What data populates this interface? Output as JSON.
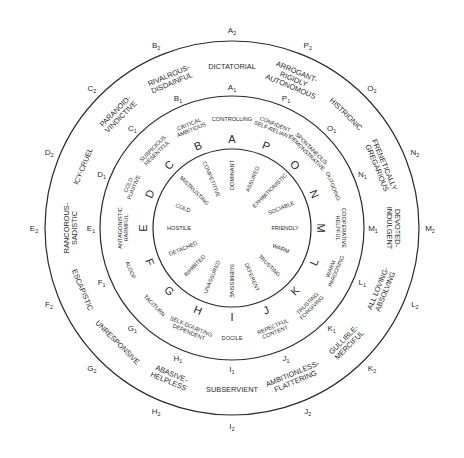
{
  "diagram": {
    "title": "",
    "center": {
      "x": 232,
      "y": 228
    },
    "radii": {
      "inner": 79,
      "middle": 132,
      "outer": 187
    },
    "line_color": "#2a2a2a",
    "octants": [
      {
        "letter": "A",
        "angle": -90,
        "inner": "DOMINANT",
        "ring1": [
          "CONTROLLING"
        ],
        "ring1_label": "A",
        "ring2": [
          "DICTATORIAL"
        ],
        "ring2_label": "A"
      },
      {
        "letter": "P",
        "angle": -67.5,
        "inner": "ASSURED",
        "ring1": [
          "CONFIDENT",
          "SELF-RELIANT"
        ],
        "ring1_label": "P",
        "ring2": [
          "ARROGANT-",
          "RIGIDLY",
          "AUTONOMOUS"
        ],
        "ring2_label": "P"
      },
      {
        "letter": "O",
        "angle": -45,
        "inner": "EXHIBITIONISTIC",
        "ring1": [
          "SPONTANEOUS",
          "DEMONSTRATIVE"
        ],
        "ring1_label": "O",
        "ring2": [
          "HISTRIONIC"
        ],
        "ring2_label": "O"
      },
      {
        "letter": "N",
        "angle": -22.5,
        "inner": "SOCIABLE",
        "ring1": [
          "OUTGOING"
        ],
        "ring1_label": "N",
        "ring2": [
          "FRENETICALLY",
          "GREGARIOUS"
        ],
        "ring2_label": "N"
      },
      {
        "letter": "M",
        "angle": 0,
        "inner": "FRIENDLY",
        "ring1": [
          "COOPERATIVE",
          "HELPFUL"
        ],
        "ring1_label": "M",
        "ring2": [
          "DEVOTED-",
          "INDULGENT"
        ],
        "ring2_label": "M"
      },
      {
        "letter": "L",
        "angle": 22.5,
        "inner": "WARM",
        "ring1": [
          "WARM",
          "PARDONING"
        ],
        "ring1_label": "L",
        "ring2": [
          "ALL LOVING-",
          "ABSOLVING"
        ],
        "ring2_label": "L"
      },
      {
        "letter": "K",
        "angle": 45,
        "inner": "TRUSTING",
        "ring1": [
          "TRUSTING",
          "FORGIVING"
        ],
        "ring1_label": "K",
        "ring2": [
          "GULLIBLE-",
          "MERCIFUL"
        ],
        "ring2_label": "K"
      },
      {
        "letter": "J",
        "angle": 67.5,
        "inner": "DEFERENT",
        "ring1": [
          "REPECTFUL",
          "CONTENT"
        ],
        "ring1_label": "J",
        "ring2": [
          "AMBITIONLESS-",
          "FLATTERING"
        ],
        "ring2_label": "J"
      },
      {
        "letter": "I",
        "angle": 90,
        "inner": "SUBMISSIVE",
        "ring1": [
          "DOCILE"
        ],
        "ring1_label": "I",
        "ring2": [
          "SUBSERVIENT"
        ],
        "ring2_label": "I"
      },
      {
        "letter": "H",
        "angle": 112.5,
        "inner": "UNASSURED",
        "ring1": [
          "SELF-DOUBTING",
          "DEPENDENT"
        ],
        "ring1_label": "H",
        "ring2": [
          "ABASIVE-",
          "HELPLESS"
        ],
        "ring2_label": "H"
      },
      {
        "letter": "G",
        "angle": 135,
        "inner": "INHIBITED",
        "ring1": [
          "TACITURN"
        ],
        "ring1_label": "G",
        "ring2": [
          "UNRESPONSIVE"
        ],
        "ring2_label": "G"
      },
      {
        "letter": "F",
        "angle": 157.5,
        "inner": "DETACHED",
        "ring1": [
          "ALOOF"
        ],
        "ring1_label": "F",
        "ring2": [
          "ESCAPISTIC"
        ],
        "ring2_label": "F"
      },
      {
        "letter": "E",
        "angle": 180,
        "inner": "HOSTILE",
        "ring1": [
          "ANTAGONISTIC",
          "HARMFUL"
        ],
        "ring1_label": "E",
        "ring2": [
          "RANCOROUS-",
          "SADISTIC"
        ],
        "ring2_label": "E"
      },
      {
        "letter": "D",
        "angle": 202.5,
        "inner": "COLD",
        "ring1": [
          "COLD",
          "PUNITIVE"
        ],
        "ring1_label": "D",
        "ring2": [
          "ICY-CRUEL"
        ],
        "ring2_label": "D"
      },
      {
        "letter": "C",
        "angle": 225,
        "inner": "MISTRUSTING",
        "ring1": [
          "SUSPICIOUS",
          "RESENTFUL"
        ],
        "ring1_label": "C",
        "ring2": [
          "PARANOID-",
          "VINDICTIVE"
        ],
        "ring2_label": "C"
      },
      {
        "letter": "B",
        "angle": 247.5,
        "inner": "COMPETITIVE",
        "ring1": [
          "CRITICAL",
          "AMBITIOUS"
        ],
        "ring1_label": "B",
        "ring2": [
          "RIVALROUS-",
          "DISDAINFUL"
        ],
        "ring2_label": "B"
      }
    ],
    "subscripts": {
      "ring1": "1",
      "ring2": "2"
    }
  }
}
